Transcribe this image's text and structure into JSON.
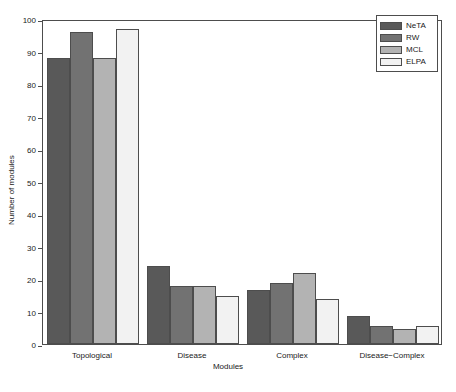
{
  "chart_data": {
    "type": "bar",
    "title": "",
    "xlabel": "Modules",
    "ylabel": "Number of modules",
    "categories": [
      "Topological",
      "Disease",
      "Complex",
      "Disease−Complex"
    ],
    "series": [
      {
        "name": "NeTA",
        "color": "#595959",
        "values": [
          88,
          24,
          16.7,
          8.5
        ]
      },
      {
        "name": "RW",
        "color": "#727272",
        "values": [
          96,
          17.8,
          18.7,
          5.5
        ]
      },
      {
        "name": "MCL",
        "color": "#b3b3b3",
        "values": [
          88,
          17.8,
          21.7,
          4.5
        ]
      },
      {
        "name": "ELPA",
        "color": "#f2f2f2",
        "values": [
          97,
          14.8,
          13.8,
          5.5
        ]
      }
    ],
    "ylim": [
      0,
      100
    ],
    "yticks": [
      0,
      10,
      20,
      30,
      40,
      50,
      60,
      70,
      80,
      90,
      100
    ],
    "ytick_labels": [
      "0",
      "10",
      "20",
      "30",
      "40",
      "50",
      "60",
      "70",
      "80",
      "90",
      "100"
    ],
    "grid": false,
    "legend_position": "top-right",
    "bar_edge_color": "#4d4d4d",
    "axis_color": "#4d4d4d",
    "background": "#ffffff"
  },
  "legend": {
    "entries": [
      {
        "label": "NeTA"
      },
      {
        "label": "RW"
      },
      {
        "label": "MCL"
      },
      {
        "label": "ELPA"
      }
    ]
  },
  "axes": {
    "y_title": "Number of modules",
    "x_title": "Modules"
  }
}
